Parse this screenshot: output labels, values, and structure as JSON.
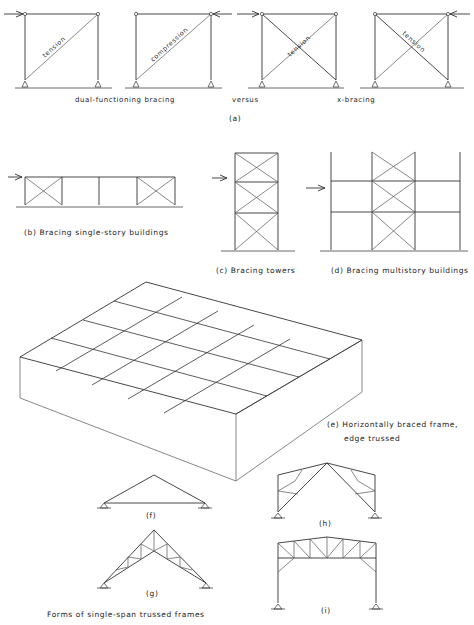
{
  "figure_a": {
    "panels": [
      {
        "diagonal_label": "tension",
        "load_side": "left",
        "type": "single-diagonal"
      },
      {
        "diagonal_label": "compression",
        "load_side": "right",
        "type": "single-diagonal"
      },
      {
        "diagonal_label": "tension",
        "load_side": "left",
        "type": "x-bracing"
      },
      {
        "diagonal_label": "tension",
        "load_side": "right",
        "type": "x-bracing"
      }
    ],
    "caption_left": "dual-functioning bracing",
    "caption_mid": "versus",
    "caption_right": "x-bracing",
    "label": "(a)"
  },
  "figure_b": {
    "label": "(b)  Bracing single-story buildings"
  },
  "figure_c": {
    "label": "(c)  Bracing towers"
  },
  "figure_d": {
    "label": "(d)  Bracing multistory buildings"
  },
  "figure_e": {
    "label_line1": "(e)  Horizontally braced frame,",
    "label_line2": "edge trussed"
  },
  "figure_f": {
    "label": "(f)"
  },
  "figure_g": {
    "label": "(g)"
  },
  "figure_h": {
    "label": "(h)"
  },
  "figure_i": {
    "label": "(i)"
  },
  "caption_trusses": "Forms of single-span trussed frames"
}
